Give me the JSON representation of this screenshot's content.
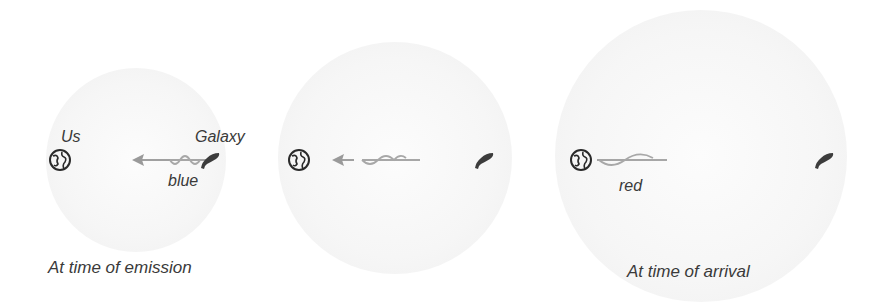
{
  "panels": [
    {
      "caption": "At time of emission",
      "observer_label": "Us",
      "source_label": "Galaxy",
      "wave_label": "blue"
    },
    {
      "caption": ""
    },
    {
      "caption": "At time of arrival",
      "wave_label": "red"
    }
  ],
  "colors": {
    "sphere": "#f3f3f3",
    "text": "#3a3a3a",
    "wave": "#a8a8a8",
    "arrow": "#9a9a9a",
    "galaxy": "#3c3c3c",
    "earth": "#2a2a2a"
  }
}
